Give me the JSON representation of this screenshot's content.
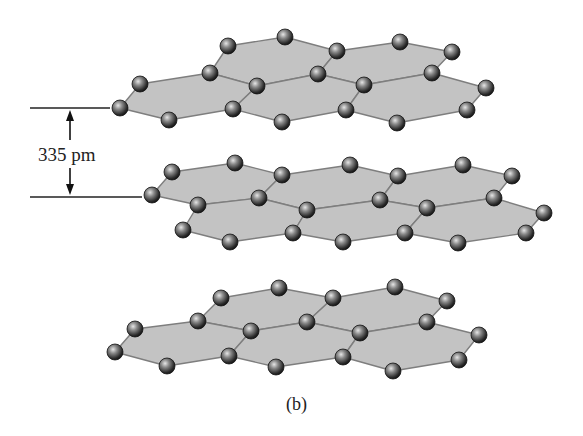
{
  "figure": {
    "caption": "(b)",
    "spacing_label": "335 pm",
    "colors": {
      "hex_fill": "#c3c3c3",
      "hex_edge": "#7e7e7e",
      "atom_dark": "#1e1e1e",
      "atom_light": "#d8d8d8",
      "line": "#222222"
    },
    "reference_lines": [
      {
        "x1": 30,
        "y1": 108,
        "x2": 110,
        "y2": 108
      },
      {
        "x1": 30,
        "y1": 197,
        "x2": 142,
        "y2": 197
      }
    ],
    "dimension_arrow": {
      "x": 70,
      "y_top": 110,
      "y_bottom": 195,
      "label_gap_top": 140,
      "label_gap_bottom": 168
    }
  },
  "layers": [
    {
      "name": "top-layer",
      "hexagons": [
        [
          [
            210,
            73
          ],
          [
            228,
            46
          ],
          [
            285,
            37
          ],
          [
            337,
            51
          ],
          [
            318,
            74
          ],
          [
            257,
            86
          ]
        ],
        [
          [
            318,
            74
          ],
          [
            337,
            51
          ],
          [
            400,
            42
          ],
          [
            452,
            52
          ],
          [
            432,
            73
          ],
          [
            364,
            85
          ]
        ],
        [
          [
            120,
            108
          ],
          [
            140,
            84
          ],
          [
            210,
            73
          ],
          [
            257,
            86
          ],
          [
            233,
            109
          ],
          [
            169,
            120
          ]
        ],
        [
          [
            257,
            86
          ],
          [
            318,
            74
          ],
          [
            364,
            85
          ],
          [
            346,
            110
          ],
          [
            282,
            122
          ],
          [
            233,
            109
          ]
        ],
        [
          [
            364,
            85
          ],
          [
            432,
            73
          ],
          [
            486,
            88
          ],
          [
            467,
            110
          ],
          [
            397,
            123
          ],
          [
            346,
            110
          ]
        ]
      ]
    },
    {
      "name": "middle-layer",
      "hexagons": [
        [
          [
            152,
            195
          ],
          [
            172,
            172
          ],
          [
            235,
            163
          ],
          [
            282,
            175
          ],
          [
            259,
            198
          ],
          [
            198,
            205
          ]
        ],
        [
          [
            282,
            175
          ],
          [
            350,
            165
          ],
          [
            398,
            176
          ],
          [
            380,
            200
          ],
          [
            307,
            210
          ],
          [
            259,
            198
          ]
        ],
        [
          [
            398,
            176
          ],
          [
            463,
            165
          ],
          [
            512,
            176
          ],
          [
            494,
            198
          ],
          [
            427,
            208
          ],
          [
            380,
            200
          ]
        ],
        [
          [
            198,
            205
          ],
          [
            259,
            198
          ],
          [
            307,
            210
          ],
          [
            293,
            233
          ],
          [
            230,
            242
          ],
          [
            183,
            230
          ]
        ],
        [
          [
            307,
            210
          ],
          [
            380,
            200
          ],
          [
            427,
            208
          ],
          [
            405,
            233
          ],
          [
            343,
            242
          ],
          [
            293,
            233
          ]
        ],
        [
          [
            427,
            208
          ],
          [
            494,
            198
          ],
          [
            544,
            213
          ],
          [
            526,
            233
          ],
          [
            458,
            243
          ],
          [
            405,
            233
          ]
        ]
      ]
    },
    {
      "name": "bottom-layer",
      "hexagons": [
        [
          [
            198,
            321
          ],
          [
            221,
            298
          ],
          [
            279,
            288
          ],
          [
            333,
            298
          ],
          [
            307,
            322
          ],
          [
            251,
            331
          ]
        ],
        [
          [
            307,
            322
          ],
          [
            333,
            298
          ],
          [
            395,
            287
          ],
          [
            447,
            301
          ],
          [
            427,
            322
          ],
          [
            360,
            333
          ]
        ],
        [
          [
            115,
            352
          ],
          [
            135,
            329
          ],
          [
            198,
            321
          ],
          [
            251,
            331
          ],
          [
            229,
            356
          ],
          [
            167,
            366
          ]
        ],
        [
          [
            251,
            331
          ],
          [
            307,
            322
          ],
          [
            360,
            333
          ],
          [
            343,
            357
          ],
          [
            276,
            367
          ],
          [
            229,
            356
          ]
        ],
        [
          [
            360,
            333
          ],
          [
            427,
            322
          ],
          [
            479,
            335
          ],
          [
            459,
            360
          ],
          [
            393,
            371
          ],
          [
            343,
            357
          ]
        ]
      ]
    }
  ]
}
